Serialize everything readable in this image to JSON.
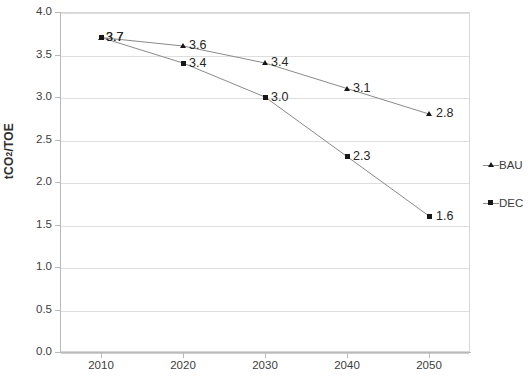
{
  "chart_data": {
    "type": "line",
    "title": "",
    "xlabel": "",
    "ylabel": "tCO2/TOE",
    "ylabel_html": "tCO₂/TOE",
    "x": [
      2010,
      2020,
      2030,
      2040,
      2050
    ],
    "xticklabels": [
      "2010",
      "2020",
      "2030",
      "2040",
      "2050"
    ],
    "yticks": [
      0.0,
      0.5,
      1.0,
      1.5,
      2.0,
      2.5,
      3.0,
      3.5,
      4.0
    ],
    "yticklabels": [
      "0.0",
      "0.5",
      "1.0",
      "1.5",
      "2.0",
      "2.5",
      "3.0",
      "3.5",
      "4.0"
    ],
    "ylim": [
      0.0,
      4.0
    ],
    "grid": "horizontal",
    "legend_position": "right-outside",
    "series": [
      {
        "name": "BAU",
        "marker": "triangle",
        "color": "#8a8a8a",
        "values": [
          3.7,
          3.6,
          3.4,
          3.1,
          2.8
        ],
        "labels": [
          "3.7",
          "3.6",
          "3.4",
          "3.1",
          "2.8"
        ]
      },
      {
        "name": "DEC",
        "marker": "square",
        "color": "#8a8a8a",
        "values": [
          3.7,
          3.4,
          3.0,
          2.3,
          1.6
        ],
        "labels": [
          "3.7",
          "3.4",
          "3.0",
          "2.3",
          "1.6"
        ]
      }
    ]
  },
  "legend": {
    "entries": [
      {
        "label": "BAU",
        "marker": "triangle"
      },
      {
        "label": "DEC",
        "marker": "square"
      }
    ]
  }
}
